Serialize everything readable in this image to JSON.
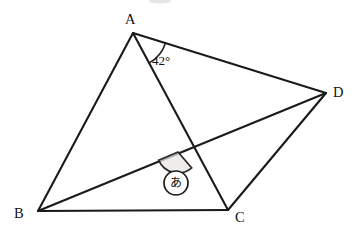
{
  "figure": {
    "background_color": "#ffffff",
    "line_color": "#1a1a1a",
    "shade_color": "#e9e6e0",
    "width": 355,
    "height": 234
  },
  "vertices": [
    {
      "id": "A",
      "label": "A",
      "x": 133,
      "y": 33,
      "label_x": 125,
      "label_y": 24
    },
    {
      "id": "B",
      "label": "B",
      "x": 38,
      "y": 211,
      "label_x": 14,
      "label_y": 218
    },
    {
      "id": "C",
      "label": "C",
      "x": 228,
      "y": 210,
      "label_x": 235,
      "label_y": 222
    },
    {
      "id": "D",
      "label": "D",
      "x": 326,
      "y": 93,
      "label_x": 333,
      "label_y": 97
    }
  ],
  "edges": [
    {
      "name": "segment-AB",
      "from": "A",
      "to": "B"
    },
    {
      "name": "segment-AC",
      "from": "A",
      "to": "C"
    },
    {
      "name": "segment-AD",
      "from": "A",
      "to": "D"
    },
    {
      "name": "segment-BC",
      "from": "B",
      "to": "C"
    },
    {
      "name": "segment-BD",
      "from": "B",
      "to": "D"
    },
    {
      "name": "segment-CD",
      "from": "C",
      "to": "D"
    }
  ],
  "intersection": {
    "name": "intersection-AC-BD",
    "x": 178,
    "y": 152
  },
  "angles": [
    {
      "name": "angle-at-A",
      "vertex": "A",
      "value": "42",
      "unit": "°",
      "label": "42°",
      "label_x": 152,
      "label_y": 65,
      "arc_radius": 34,
      "between": [
        "AC",
        "AD"
      ],
      "shaded": false
    },
    {
      "name": "angle-marked-unknown",
      "vertex": "intersection-AC-BD",
      "label": "あ",
      "marker_shape": "circled-character",
      "marker_x": 176,
      "marker_y": 183,
      "marker_radius": 12,
      "arc_radius": 21,
      "between": [
        "BD",
        "AC"
      ],
      "shaded": true
    }
  ]
}
